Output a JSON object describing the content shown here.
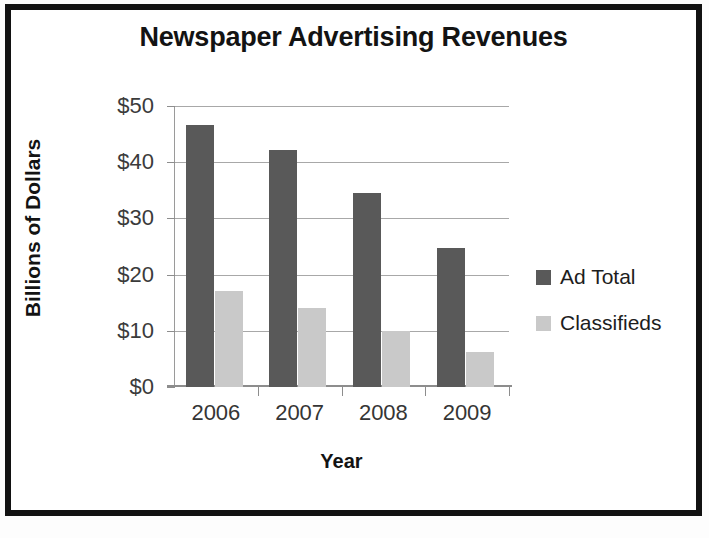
{
  "chart_data": {
    "type": "bar",
    "title": "Newspaper Advertising Revenues",
    "xlabel": "Year",
    "ylabel": "Billions of Dollars",
    "categories": [
      "2006",
      "2007",
      "2008",
      "2009"
    ],
    "series": [
      {
        "name": "Ad Total",
        "color": "#595959",
        "values": [
          46.6,
          42.2,
          34.6,
          24.8
        ]
      },
      {
        "name": "Classifieds",
        "color": "#c9c9c9",
        "values": [
          17.0,
          14.1,
          10.0,
          6.2
        ]
      }
    ],
    "ylim": [
      0,
      50
    ],
    "yticks": [
      0,
      10,
      20,
      30,
      40,
      50
    ],
    "ytick_labels": [
      "$0",
      "$10",
      "$20",
      "$30",
      "$40",
      "$50"
    ],
    "grid": "horizontal",
    "legend_position": "right",
    "frame_color": "#121212",
    "gridline_color": "#a8a8a8",
    "background": "#ffffff"
  }
}
